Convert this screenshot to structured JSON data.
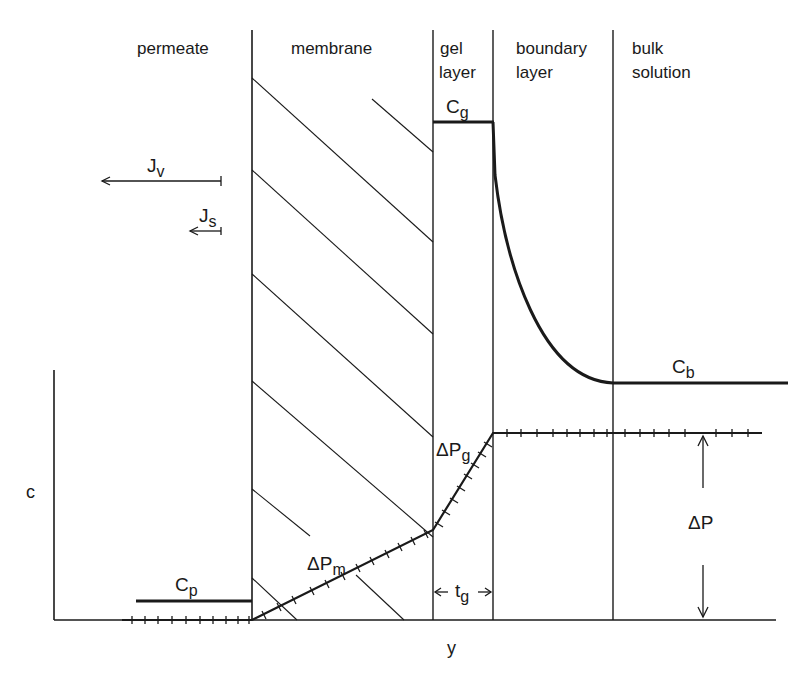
{
  "regions": {
    "permeate": "permeate",
    "membrane": "membrane",
    "gel_layer_1": "gel",
    "gel_layer_2": "layer",
    "boundary_layer_1": "boundary",
    "boundary_layer_2": "layer",
    "bulk_solution_1": "bulk",
    "bulk_solution_2": "solution"
  },
  "symbols": {
    "Cg": {
      "base": "C",
      "sub": "g"
    },
    "Cb": {
      "base": "C",
      "sub": "b"
    },
    "Cp": {
      "base": "C",
      "sub": "p"
    },
    "Jv": {
      "base": "J",
      "sub": "v"
    },
    "Js": {
      "base": "J",
      "sub": "s"
    },
    "dPm": {
      "base": "ΔP",
      "sub": "m"
    },
    "dPg": {
      "base": "ΔP",
      "sub": "g"
    },
    "dP": {
      "base": "ΔP"
    },
    "tg": {
      "base": "t",
      "sub": "g"
    }
  },
  "axes": {
    "y_label": "c",
    "x_label": "y"
  },
  "colors": {
    "ink": "#1a1a1a",
    "background": "#ffffff"
  }
}
